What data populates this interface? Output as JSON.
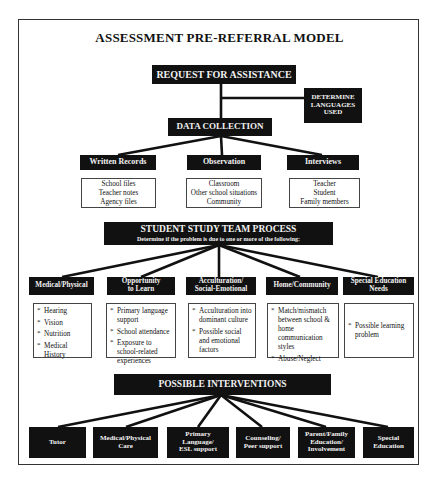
{
  "title": "ASSESSMENT PRE-REFERRAL MODEL",
  "request": {
    "label": "REQUEST FOR ASSISTANCE"
  },
  "languages": {
    "label_line1": "DETERMINE",
    "label_line2": "LANGUAGES",
    "label_line3": "USED"
  },
  "data_collection": {
    "label": "DATA COLLECTION",
    "sources": [
      {
        "label": "Written Records",
        "items": [
          "School files",
          "Teacher notes",
          "Agency files"
        ]
      },
      {
        "label": "Observation",
        "items": [
          "Classroom",
          "Other school situations",
          "Community"
        ]
      },
      {
        "label": "Interviews",
        "items": [
          "Teacher",
          "Student",
          "Family members"
        ]
      }
    ]
  },
  "sst": {
    "label": "STUDENT STUDY TEAM PROCESS",
    "sublabel": "Determine if the problem is due to one or more of the following:",
    "factors": [
      {
        "label_line1": "Medical/Physical",
        "label_line2": "",
        "items": [
          "Hearing",
          "Vision",
          "Nutrition",
          "Medical History"
        ]
      },
      {
        "label_line1": "Opportunity",
        "label_line2": "to Learn",
        "items": [
          "Primary language support",
          "School attendance",
          "Exposure to school-related experiences"
        ]
      },
      {
        "label_line1": "Acculturation/",
        "label_line2": "Social-Emotional",
        "items": [
          "Acculturation into dominant culture",
          "Possible social and emotional factors"
        ]
      },
      {
        "label_line1": "Home/Community",
        "label_line2": "",
        "items": [
          "Match/mismatch between school & home communication styles",
          "Abuse/Neglect"
        ]
      },
      {
        "label_line1": "Special Education",
        "label_line2": "Needs",
        "items": [
          "Possible learning problem"
        ]
      }
    ]
  },
  "interventions": {
    "label": "POSSIBLE INTERVENTIONS",
    "options": [
      {
        "l1": "Tutor",
        "l2": "",
        "l3": ""
      },
      {
        "l1": "Medical/Physical",
        "l2": "Care",
        "l3": ""
      },
      {
        "l1": "Primary",
        "l2": "Language/",
        "l3": "ESL support"
      },
      {
        "l1": "Counseling/",
        "l2": "Peer support",
        "l3": ""
      },
      {
        "l1": "Parent/Family",
        "l2": "Education/",
        "l3": "Involvement"
      },
      {
        "l1": "Special",
        "l2": "Education",
        "l3": ""
      }
    ]
  },
  "colors": {
    "box_dark": "#111111",
    "box_text": "#f2f2f2",
    "line": "#111111",
    "frame": "#333333"
  }
}
